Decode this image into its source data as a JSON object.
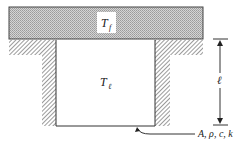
{
  "diagram": {
    "labels": {
      "top_slab_temperature": "T",
      "top_slab_temperature_sub": "f",
      "cavity_temperature": "T",
      "cavity_temperature_sub": "ℓ",
      "length_dimension": "ℓ",
      "properties": "A, ρ, c, k"
    },
    "colors": {
      "slab_fill": "#c8c8c8",
      "hatch": "#6a6a6a",
      "line": "#333333",
      "background": "#ffffff"
    }
  }
}
